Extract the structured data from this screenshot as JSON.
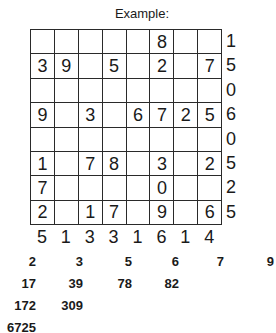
{
  "title": "Example:",
  "grid": [
    [
      "",
      "",
      "",
      "",
      "",
      "8",
      "",
      ""
    ],
    [
      "3",
      "9",
      "",
      "5",
      "",
      "2",
      "",
      "7"
    ],
    [
      "",
      "",
      "",
      "",
      "",
      "",
      "",
      ""
    ],
    [
      "9",
      "",
      "3",
      "",
      "6",
      "7",
      "2",
      "5"
    ],
    [
      "",
      "",
      "",
      "",
      "",
      "",
      "",
      ""
    ],
    [
      "1",
      "",
      "7",
      "8",
      "",
      "3",
      "",
      "2"
    ],
    [
      "7",
      "",
      "",
      "",
      "",
      "0",
      "",
      ""
    ],
    [
      "2",
      "",
      "1",
      "7",
      "",
      "9",
      "",
      "6"
    ]
  ],
  "row_sums": [
    "1",
    "5",
    "0",
    "6",
    "0",
    "5",
    "2",
    "5"
  ],
  "col_sums": [
    "5",
    "1",
    "3",
    "3",
    "1",
    "6",
    "1",
    "4"
  ],
  "number_list": [
    [
      "2",
      "3",
      "5",
      "6",
      "7",
      "9"
    ],
    [
      "17",
      "39",
      "78",
      "82"
    ],
    [
      "172",
      "309"
    ],
    [
      "6725"
    ]
  ]
}
